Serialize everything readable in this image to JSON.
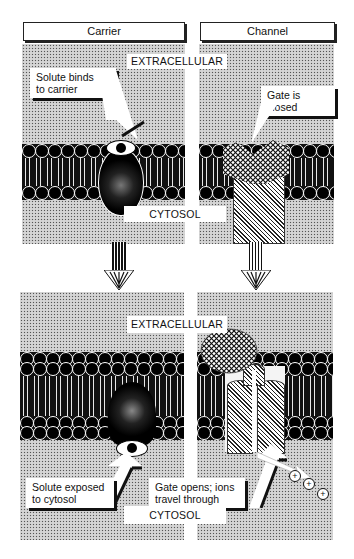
{
  "panels": {
    "carrier": {
      "title": "Carrier",
      "before_callout": [
        "Solute binds",
        "to carrier"
      ],
      "after_callout": [
        "Solute exposed",
        "to cytosol"
      ]
    },
    "channel": {
      "title": "Channel",
      "before_callout": [
        "Gate is closed"
      ],
      "after_callout": [
        "Gate opens; ions",
        "travel through"
      ]
    }
  },
  "zones": {
    "top_extracellular": "EXTRACELLULAR",
    "top_cytosol": "CYTOSOL",
    "bottom_extracellular": "EXTRACELLULAR",
    "bottom_cytosol": "CYTOSOL"
  },
  "ions": [
    "+",
    "+",
    "+"
  ],
  "colors": {
    "ink": "#111111",
    "paper": "#ffffff",
    "stipple": "#f4f4f4"
  }
}
